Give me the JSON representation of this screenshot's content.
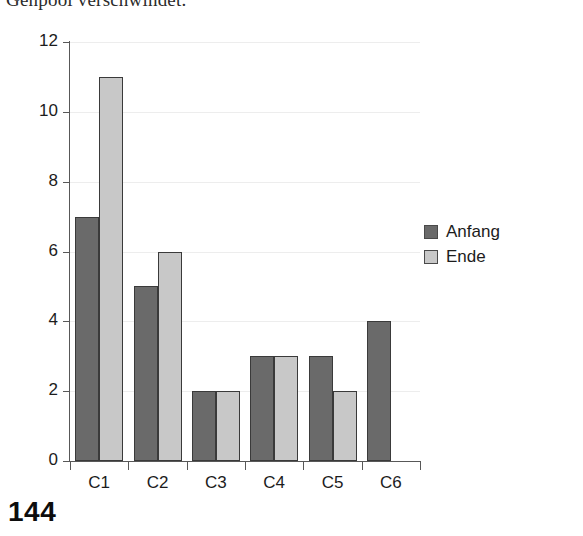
{
  "page": {
    "heading_text": "Genpool verschwindet.",
    "page_number": "144"
  },
  "colors": {
    "anfang": "#6a6a6a",
    "ende": "#c8c8c8",
    "axis": "#585858",
    "grid": "#ededed",
    "text": "#1c1c1c"
  },
  "chart_data": {
    "type": "bar",
    "title": "",
    "xlabel": "",
    "ylabel": "",
    "categories": [
      "C1",
      "C2",
      "C3",
      "C4",
      "C5",
      "C6"
    ],
    "series": [
      {
        "name": "Anfang",
        "color": "#6a6a6a",
        "values": [
          7,
          5,
          2,
          3,
          3,
          4
        ]
      },
      {
        "name": "Ende",
        "color": "#c8c8c8",
        "values": [
          11,
          6,
          2,
          3,
          2,
          null
        ]
      }
    ],
    "ylim": [
      0,
      12
    ],
    "yticks": [
      0,
      2,
      4,
      6,
      8,
      10,
      12
    ],
    "ytick_labels": [
      "0",
      "2",
      "4",
      "6",
      "8",
      "10",
      "12"
    ],
    "grid": "horizontal",
    "legend_position": "right"
  }
}
